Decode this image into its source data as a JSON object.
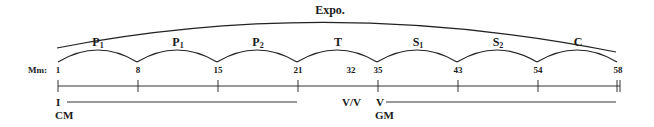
{
  "diagram": {
    "title": "Expo.",
    "measure_label": "Mm:",
    "sections": [
      {
        "label": "P",
        "sub": "1",
        "start": "1",
        "end": "8"
      },
      {
        "label": "P",
        "sub": "1",
        "start": "8",
        "end": "15"
      },
      {
        "label": "P",
        "sub": "2",
        "start": "15",
        "end": "21"
      },
      {
        "label": "T",
        "sub": "",
        "start": "21",
        "end": "35"
      },
      {
        "label": "S",
        "sub": "1",
        "start": "35",
        "end": "43"
      },
      {
        "label": "S",
        "sub": "2",
        "start": "43",
        "end": "54"
      },
      {
        "label": "C",
        "sub": "",
        "start": "54",
        "end": "58"
      }
    ],
    "measures": [
      "1",
      "8",
      "15",
      "21",
      "32",
      "35",
      "43",
      "54",
      "58"
    ],
    "harmony": {
      "first_key_function": "I",
      "first_key_area": "CM",
      "medial_caesura": "V/V",
      "second_key_function": "V",
      "second_key_area": "GM"
    }
  }
}
